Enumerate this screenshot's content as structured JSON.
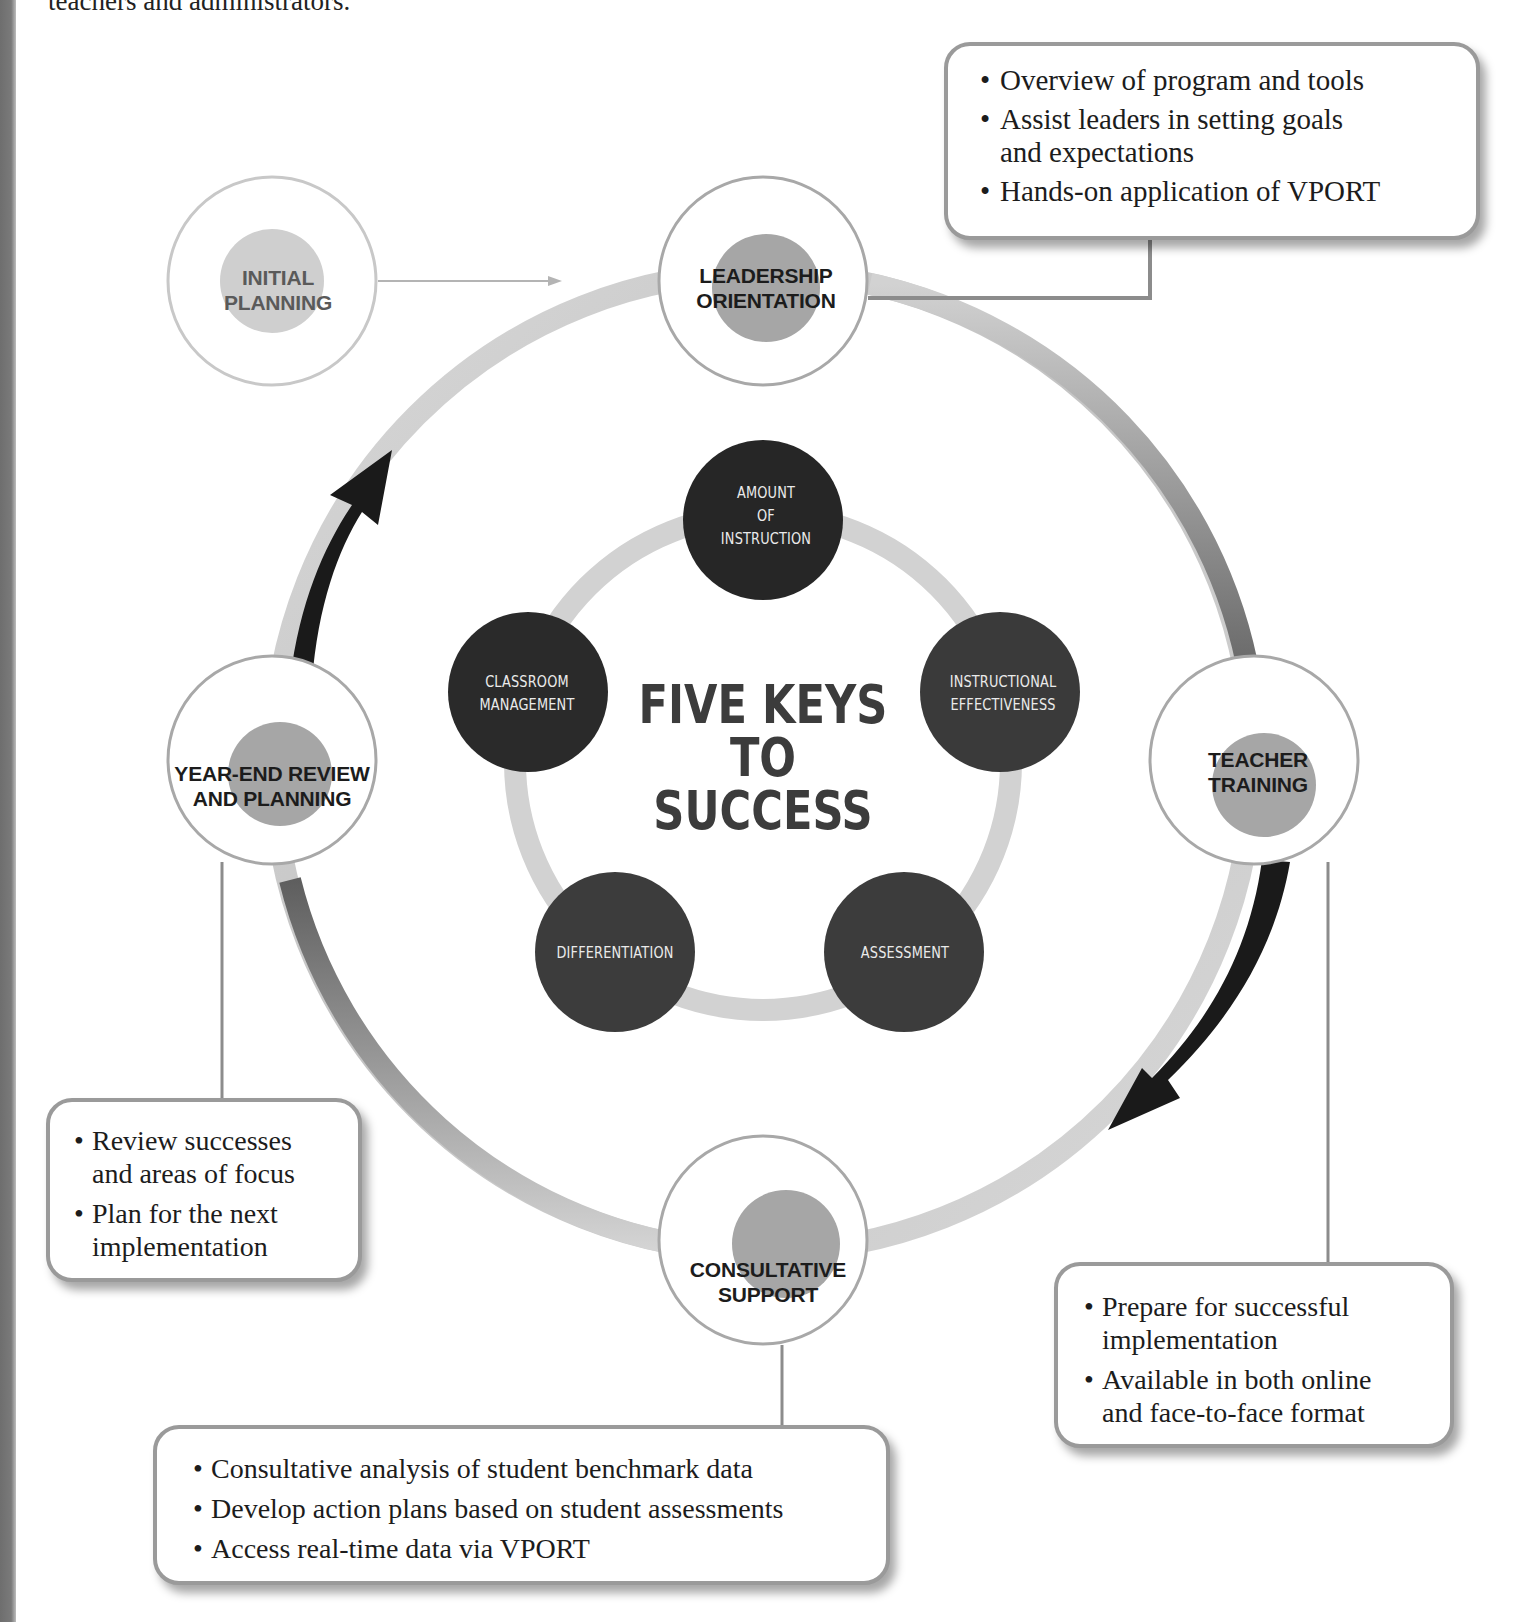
{
  "page": {
    "top_caption": "teachers and administrators."
  },
  "diagram": {
    "title": "FIVE KEYS TO SUCCESS",
    "title_lines": [
      "FIVE KEYS",
      "TO",
      "SUCCESS"
    ],
    "colors": {
      "stage_border": "#a8a8a8",
      "stage_inner_disc": "#a6a6a6",
      "key_circle": "#2e2e2e",
      "inner_ring": "#d2d2d2",
      "outer_ring_dark": "#6a6a6a",
      "outer_ring_light": "#d6d6d6",
      "arrow": "#1a1a1a",
      "callout_border": "#9a9a9a"
    },
    "stages": [
      {
        "id": "initial-planning",
        "lines": [
          "INITIAL",
          "PLANNING"
        ],
        "label": "INITIAL PLANNING"
      },
      {
        "id": "leadership-orientation",
        "lines": [
          "LEADERSHIP",
          "ORIENTATION"
        ],
        "label": "LEADERSHIP ORIENTATION"
      },
      {
        "id": "teacher-training",
        "lines": [
          "TEACHER",
          "TRAINING"
        ],
        "label": "TEACHER TRAINING"
      },
      {
        "id": "consultative-support",
        "lines": [
          "CONSULTATIVE",
          "SUPPORT"
        ],
        "label": "CONSULTATIVE SUPPORT"
      },
      {
        "id": "year-end-review",
        "lines": [
          "YEAR-END REVIEW",
          "AND PLANNING"
        ],
        "label": "YEAR-END REVIEW AND PLANNING"
      }
    ],
    "keys": [
      {
        "id": "amount-of-instruction",
        "lines": [
          "AMOUNT",
          "OF",
          "INSTRUCTION"
        ]
      },
      {
        "id": "instructional-effectiveness",
        "lines": [
          "INSTRUCTIONAL",
          "EFFECTIVENESS"
        ]
      },
      {
        "id": "assessment",
        "lines": [
          "ASSESSMENT"
        ]
      },
      {
        "id": "differentiation",
        "lines": [
          "DIFFERENTIATION"
        ]
      },
      {
        "id": "classroom-management",
        "lines": [
          "CLASSROOM",
          "MANAGEMENT"
        ]
      }
    ],
    "callouts": {
      "leadership": [
        [
          "Overview of program and tools"
        ],
        [
          "Assist leaders in setting goals",
          "and expectations"
        ],
        [
          "Hands-on application of VPORT"
        ]
      ],
      "year_end": [
        [
          "Review successes",
          "and areas of focus"
        ],
        [
          "Plan for the next",
          "implementation"
        ]
      ],
      "teacher": [
        [
          "Prepare for successful",
          "implementation"
        ],
        [
          "Available in both online",
          "and face-to-face format"
        ]
      ],
      "consultative": [
        [
          "Consultative analysis of student benchmark data"
        ],
        [
          "Develop action plans based on student assessments"
        ],
        [
          "Access real-time data via VPORT"
        ]
      ]
    }
  }
}
